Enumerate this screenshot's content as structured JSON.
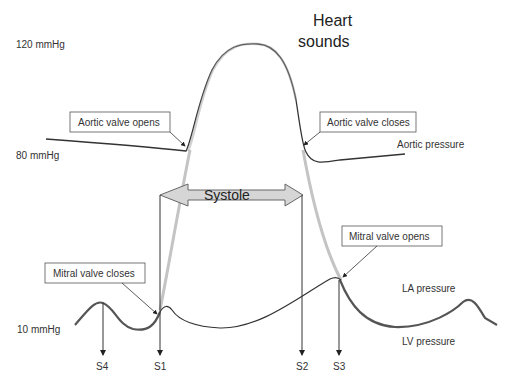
{
  "title": "Heart sounds",
  "title_lines": [
    "Heart",
    "sounds"
  ],
  "y_labels": {
    "high": "120 mmHg",
    "mid": "80 mmHg",
    "low": "10 mmHg"
  },
  "annotations": {
    "aortic_opens": "Aortic valve opens",
    "aortic_closes": "Aortic valve closes",
    "mitral_opens": "Mitral valve opens",
    "mitral_closes": "Mitral valve closes"
  },
  "curve_labels": {
    "aortic": "Aortic pressure",
    "la": "LA pressure",
    "lv": "LV pressure"
  },
  "phase": "Systole",
  "sounds": [
    "S4",
    "S1",
    "S2",
    "S3"
  ],
  "colors": {
    "line": "#333333",
    "highlight": "#bdbdbd",
    "arrow_fill": "#d6d6d6",
    "box_border": "#555555"
  }
}
